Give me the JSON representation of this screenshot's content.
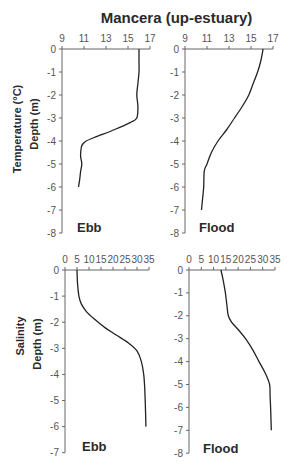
{
  "figure": {
    "title": "Mancera (up-estuary)",
    "row_labels": [
      {
        "variable": "Temperature (°C)",
        "depth": "Depth (m)"
      },
      {
        "variable": "Salinity",
        "depth": "Depth (m)"
      }
    ],
    "panel_labels": [
      "Ebb",
      "Flood",
      "Ebb",
      "Flood"
    ]
  },
  "chart_data": [
    {
      "type": "line",
      "title": "Ebb",
      "row": "Temperature (°C)",
      "xlabel": "Temperature (°C)",
      "ylabel": "Depth (m)",
      "xlim": [
        9,
        17
      ],
      "xticks": [
        9,
        11,
        13,
        15,
        17
      ],
      "ylim": [
        -8,
        0
      ],
      "yticks": [
        0,
        -1,
        -2,
        -3,
        -4,
        -5,
        -6,
        -7,
        -8
      ],
      "x_axis_position": "top",
      "grid": false,
      "x": [
        16.0,
        16.0,
        16.0,
        15.9,
        15.8,
        15.9,
        15.8,
        15.2,
        13.8,
        12.2,
        11.2,
        10.8,
        10.7,
        10.7,
        10.8,
        10.7,
        10.6,
        10.5
      ],
      "y": [
        0,
        -0.5,
        -1.0,
        -1.5,
        -2.0,
        -2.5,
        -3.0,
        -3.2,
        -3.5,
        -3.8,
        -4.0,
        -4.2,
        -4.5,
        -4.7,
        -5.0,
        -5.3,
        -5.7,
        -6.0
      ]
    },
    {
      "type": "line",
      "title": "Flood",
      "row": "Temperature (°C)",
      "xlabel": "Temperature (°C)",
      "ylabel": "Depth (m)",
      "xlim": [
        9,
        17
      ],
      "xticks": [
        9,
        11,
        13,
        15,
        17
      ],
      "ylim": [
        -8,
        0
      ],
      "yticks": [
        0,
        -1,
        -2,
        -3,
        -4,
        -5,
        -6,
        -7,
        -8
      ],
      "x_axis_position": "top",
      "grid": false,
      "x": [
        16.1,
        15.9,
        15.6,
        15.2,
        14.8,
        14.2,
        13.5,
        12.8,
        12.0,
        11.4,
        11.0,
        10.75,
        10.7,
        10.6,
        10.5
      ],
      "y": [
        0,
        -0.5,
        -1.0,
        -1.5,
        -2.0,
        -2.5,
        -3.0,
        -3.5,
        -4.0,
        -4.5,
        -5.0,
        -5.3,
        -6.0,
        -6.5,
        -7.0
      ]
    },
    {
      "type": "line",
      "title": "Ebb",
      "row": "Salinity",
      "xlabel": "Salinity",
      "ylabel": "Depth (m)",
      "xlim": [
        0,
        35
      ],
      "xticks": [
        0,
        5,
        10,
        15,
        20,
        25,
        30,
        35
      ],
      "ylim": [
        -7,
        0
      ],
      "yticks": [
        0,
        -1,
        -2,
        -3,
        -4,
        -5,
        -6,
        -7
      ],
      "x_axis_position": "top",
      "grid": false,
      "x": [
        5.0,
        5.2,
        5.8,
        6.8,
        9.0,
        12.5,
        16.5,
        21.5,
        26.5,
        30.0,
        31.8,
        32.8,
        33.2,
        33.4,
        33.6,
        33.7
      ],
      "y": [
        0,
        -0.5,
        -1.0,
        -1.3,
        -1.6,
        -1.9,
        -2.2,
        -2.5,
        -2.8,
        -3.1,
        -3.5,
        -4.0,
        -4.5,
        -5.0,
        -5.5,
        -6.0
      ]
    },
    {
      "type": "line",
      "title": "Flood",
      "row": "Salinity",
      "xlabel": "Salinity",
      "ylabel": "Depth (m)",
      "xlim": [
        0,
        35
      ],
      "xticks": [
        0,
        5,
        10,
        15,
        20,
        25,
        30,
        35
      ],
      "ylim": [
        -8,
        0
      ],
      "yticks": [
        0,
        -1,
        -2,
        -3,
        -4,
        -5,
        -6,
        -7,
        -8
      ],
      "x_axis_position": "top",
      "grid": false,
      "x": [
        13.0,
        14.0,
        14.8,
        15.4,
        16.0,
        17.5,
        20.0,
        23.0,
        26.0,
        28.5,
        31.0,
        32.8,
        33.0,
        33.2,
        33.5
      ],
      "y": [
        0,
        -0.5,
        -1.0,
        -1.5,
        -2.0,
        -2.3,
        -2.6,
        -3.0,
        -3.5,
        -4.0,
        -4.5,
        -5.0,
        -5.5,
        -6.0,
        -7.0
      ]
    }
  ]
}
